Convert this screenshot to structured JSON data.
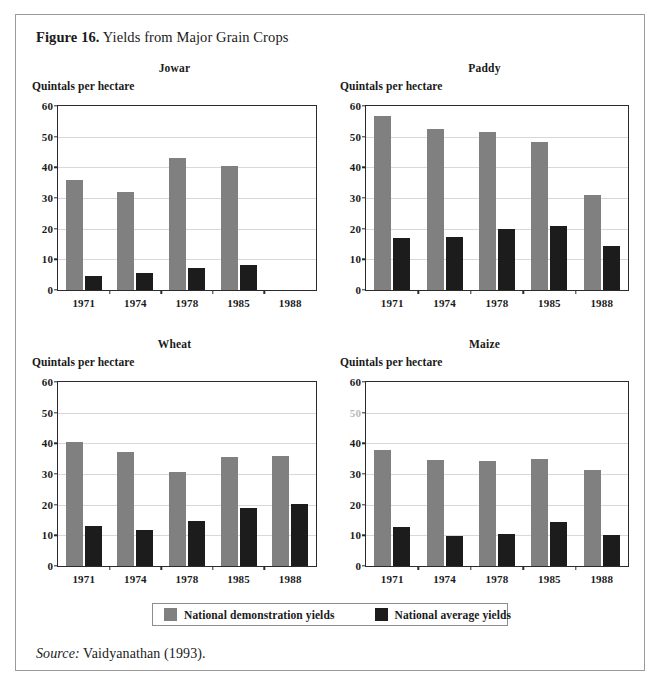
{
  "figure": {
    "label": "Figure 16.",
    "caption": "Yields from Major Grain Crops"
  },
  "source": {
    "label": "Source:",
    "text": "Vaidyanathan (1993)."
  },
  "legend": {
    "items": [
      {
        "key": "demo",
        "label": "National demonstration yields",
        "color": "#808080"
      },
      {
        "key": "avg",
        "label": "National average yields",
        "color": "#1c1c1c"
      }
    ]
  },
  "axis": {
    "ylabel": "Quintals per hectare",
    "yticks": [
      "0",
      "10",
      "20",
      "30",
      "40",
      "50",
      "60"
    ],
    "ylim": [
      0,
      60
    ],
    "xticks": [
      "1971",
      "1974",
      "1978",
      "1985",
      "1988"
    ]
  },
  "chart_data": [
    {
      "type": "bar",
      "title": "Jowar",
      "xlabel": "",
      "ylabel": "Quintals per hectare",
      "ylim": [
        0,
        60
      ],
      "grid": true,
      "legend_position": "bottom",
      "categories": [
        "1971",
        "1974",
        "1978",
        "1985",
        "1988"
      ],
      "series": [
        {
          "name": "National demonstration yields",
          "color": "#808080",
          "values": [
            35.8,
            32.0,
            43.0,
            40.5,
            null
          ]
        },
        {
          "name": "National average yields",
          "color": "#1c1c1c",
          "values": [
            4.5,
            5.4,
            7.2,
            8.3,
            null
          ]
        }
      ]
    },
    {
      "type": "bar",
      "title": "Paddy",
      "xlabel": "",
      "ylabel": "Quintals per hectare",
      "ylim": [
        0,
        60
      ],
      "grid": true,
      "legend_position": "bottom",
      "categories": [
        "1971",
        "1974",
        "1978",
        "1985",
        "1988"
      ],
      "series": [
        {
          "name": "National demonstration yields",
          "color": "#808080",
          "values": [
            56.7,
            52.6,
            51.6,
            48.3,
            31.1
          ]
        },
        {
          "name": "National average yields",
          "color": "#1c1c1c",
          "values": [
            16.8,
            17.3,
            19.8,
            20.8,
            14.2
          ]
        }
      ]
    },
    {
      "type": "bar",
      "title": "Wheat",
      "xlabel": "",
      "ylabel": "Quintals per hectare",
      "ylim": [
        0,
        60
      ],
      "grid": true,
      "legend_position": "bottom",
      "categories": [
        "1971",
        "1974",
        "1978",
        "1985",
        "1988"
      ],
      "series": [
        {
          "name": "National demonstration yields",
          "color": "#808080",
          "values": [
            40.6,
            37.3,
            30.8,
            35.5,
            36.0
          ]
        },
        {
          "name": "National average yields",
          "color": "#1c1c1c",
          "values": [
            13.0,
            11.7,
            14.8,
            18.8,
            20.1
          ]
        }
      ]
    },
    {
      "type": "bar",
      "title": "Maize",
      "xlabel": "",
      "ylabel": "Quintals per hectare",
      "ylim": [
        0,
        60
      ],
      "grid": true,
      "legend_position": "bottom",
      "categories": [
        "1971",
        "1974",
        "1978",
        "1985",
        "1988"
      ],
      "series": [
        {
          "name": "National demonstration yields",
          "color": "#808080",
          "values": [
            37.8,
            34.7,
            34.3,
            35.0,
            31.2
          ]
        },
        {
          "name": "National average yields",
          "color": "#1c1c1c",
          "values": [
            12.7,
            9.7,
            10.4,
            14.5,
            10.2
          ]
        }
      ]
    }
  ],
  "panel_layout": [
    {
      "index": 0,
      "left": 32,
      "top": 62,
      "plot_left": 25,
      "plot_top": 43,
      "plot_width": 260,
      "plot_height": 186,
      "faded_ticks": []
    },
    {
      "index": 1,
      "left": 340,
      "top": 62,
      "plot_left": 25,
      "plot_top": 43,
      "plot_width": 264,
      "plot_height": 186,
      "faded_ticks": []
    },
    {
      "index": 2,
      "left": 32,
      "top": 338,
      "plot_left": 25,
      "plot_top": 43,
      "plot_width": 260,
      "plot_height": 186,
      "faded_ticks": []
    },
    {
      "index": 3,
      "left": 340,
      "top": 338,
      "plot_left": 25,
      "plot_top": 43,
      "plot_width": 264,
      "plot_height": 186,
      "faded_ticks": [
        5
      ]
    }
  ]
}
